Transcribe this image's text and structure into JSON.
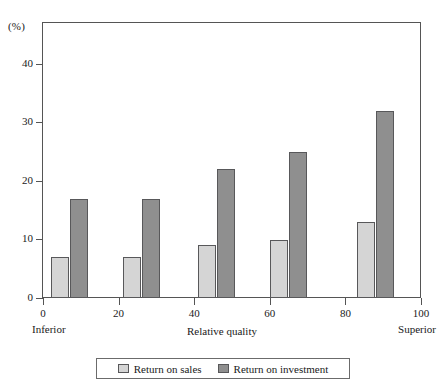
{
  "chart_data": {
    "type": "bar",
    "title": "",
    "subtitle": "",
    "xlabel": "Relative quality",
    "ylabel": "",
    "y_unit_label": "(%)",
    "xlim": [
      0,
      100
    ],
    "ylim": [
      0,
      47
    ],
    "grid": false,
    "x": [
      7,
      26,
      46,
      65,
      88
    ],
    "categories": [
      "7",
      "26",
      "46",
      "65",
      "88"
    ],
    "series": [
      {
        "name": "Return on sales",
        "color": "#d5d5d5",
        "values": [
          7,
          7,
          9,
          10,
          13
        ]
      },
      {
        "name": "Return on investment",
        "color": "#8f8f8f",
        "values": [
          17,
          17,
          22,
          25,
          32
        ]
      }
    ],
    "y_ticks": [
      0,
      10,
      20,
      30,
      40
    ],
    "y_tick_labels": [
      "0",
      "10",
      "20",
      "30",
      "40"
    ],
    "x_ticks": [
      0,
      20,
      40,
      60,
      80,
      100
    ],
    "x_tick_labels": [
      "0",
      "20",
      "40",
      "60",
      "80",
      "100"
    ],
    "x_endpoint_labels": {
      "left": "Inferior",
      "right": "Superior"
    },
    "legend": {
      "position": "bottom-center",
      "entries": [
        {
          "label": "Return on sales",
          "swatch": "legend-swatch-sales"
        },
        {
          "label": "Return on investment",
          "swatch": "legend-swatch-investment"
        }
      ]
    },
    "colors": {
      "sales": "#d5d5d5",
      "investment": "#8f8f8f",
      "axis": "#555555",
      "bar_outline": "#58585a",
      "background": "#ffffff"
    }
  }
}
